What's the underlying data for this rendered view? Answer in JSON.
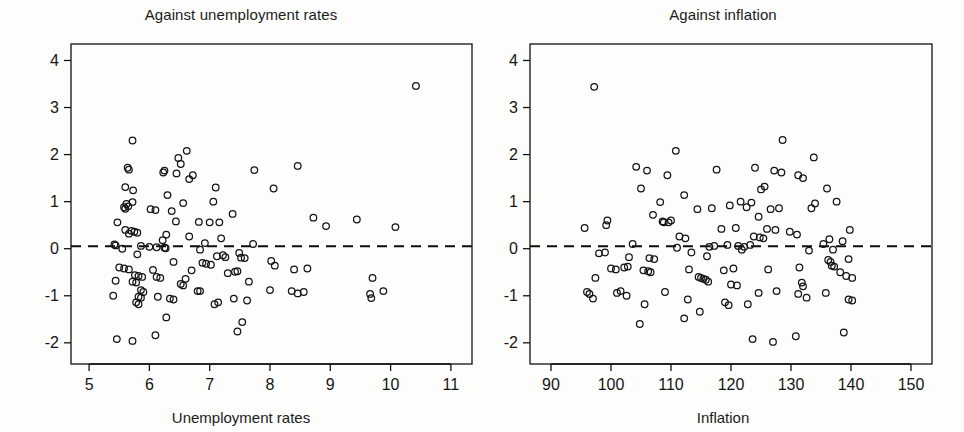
{
  "chart_data": [
    {
      "type": "scatter",
      "title": "Against unemployment rates",
      "xlabel": "Unemployment rates",
      "ylabel": "",
      "xlim": [
        4.7,
        11.35
      ],
      "ylim": [
        -2.45,
        4.35
      ],
      "xticks": [
        5,
        6,
        7,
        8,
        9,
        10,
        11
      ],
      "yticks": [
        -2,
        -1,
        0,
        1,
        2,
        3,
        4
      ],
      "xticklabels": [
        "5",
        "6",
        "7",
        "8",
        "9",
        "10",
        "11"
      ],
      "yticklabels": [
        "-2",
        "-1",
        "0",
        "1",
        "2",
        "3",
        "4"
      ],
      "grid": false,
      "legend": "none",
      "reference_line": {
        "orientation": "horizontal",
        "y": 0.05,
        "style": "dashed"
      },
      "marker": "open-circle",
      "points": [
        [
          10.42,
          3.46
        ],
        [
          5.72,
          2.3
        ],
        [
          6.62,
          2.08
        ],
        [
          6.48,
          1.93
        ],
        [
          6.52,
          1.8
        ],
        [
          8.46,
          1.76
        ],
        [
          5.64,
          1.72
        ],
        [
          5.66,
          1.68
        ],
        [
          7.74,
          1.67
        ],
        [
          6.25,
          1.66
        ],
        [
          6.23,
          1.62
        ],
        [
          6.45,
          1.6
        ],
        [
          6.72,
          1.56
        ],
        [
          6.66,
          1.48
        ],
        [
          5.6,
          1.31
        ],
        [
          7.1,
          1.3
        ],
        [
          8.06,
          1.28
        ],
        [
          5.73,
          1.24
        ],
        [
          6.3,
          1.14
        ],
        [
          7.06,
          1.0
        ],
        [
          5.72,
          0.99
        ],
        [
          6.56,
          0.97
        ],
        [
          5.62,
          0.95
        ],
        [
          5.65,
          0.9
        ],
        [
          5.58,
          0.88
        ],
        [
          5.6,
          0.85
        ],
        [
          6.02,
          0.84
        ],
        [
          6.1,
          0.82
        ],
        [
          6.37,
          0.8
        ],
        [
          7.38,
          0.74
        ],
        [
          8.72,
          0.66
        ],
        [
          9.44,
          0.62
        ],
        [
          6.44,
          0.58
        ],
        [
          6.82,
          0.57
        ],
        [
          7.0,
          0.56
        ],
        [
          7.16,
          0.56
        ],
        [
          5.47,
          0.56
        ],
        [
          8.93,
          0.48
        ],
        [
          10.08,
          0.46
        ],
        [
          5.6,
          0.4
        ],
        [
          5.7,
          0.38
        ],
        [
          5.75,
          0.36
        ],
        [
          5.8,
          0.34
        ],
        [
          5.66,
          0.32
        ],
        [
          6.28,
          0.3
        ],
        [
          6.66,
          0.26
        ],
        [
          7.19,
          0.22
        ],
        [
          6.22,
          0.18
        ],
        [
          6.92,
          0.12
        ],
        [
          7.72,
          0.1
        ],
        [
          5.42,
          0.09
        ],
        [
          5.44,
          0.07
        ],
        [
          5.86,
          0.06
        ],
        [
          6.0,
          0.04
        ],
        [
          6.12,
          0.03
        ],
        [
          6.25,
          0.02
        ],
        [
          6.27,
          0.01
        ],
        [
          5.55,
          0.0
        ],
        [
          6.84,
          -0.02
        ],
        [
          7.49,
          -0.09
        ],
        [
          5.8,
          -0.12
        ],
        [
          7.22,
          -0.14
        ],
        [
          7.12,
          -0.16
        ],
        [
          7.26,
          -0.18
        ],
        [
          7.52,
          -0.19
        ],
        [
          7.58,
          -0.2
        ],
        [
          8.02,
          -0.26
        ],
        [
          6.4,
          -0.28
        ],
        [
          6.88,
          -0.3
        ],
        [
          6.94,
          -0.32
        ],
        [
          7.02,
          -0.34
        ],
        [
          8.08,
          -0.36
        ],
        [
          5.5,
          -0.4
        ],
        [
          5.58,
          -0.42
        ],
        [
          5.66,
          -0.44
        ],
        [
          6.06,
          -0.45
        ],
        [
          8.4,
          -0.44
        ],
        [
          8.62,
          -0.42
        ],
        [
          6.7,
          -0.46
        ],
        [
          7.3,
          -0.52
        ],
        [
          7.42,
          -0.49
        ],
        [
          7.46,
          -0.48
        ],
        [
          5.76,
          -0.56
        ],
        [
          5.82,
          -0.58
        ],
        [
          5.88,
          -0.6
        ],
        [
          6.12,
          -0.6
        ],
        [
          6.18,
          -0.62
        ],
        [
          6.6,
          -0.64
        ],
        [
          9.7,
          -0.62
        ],
        [
          5.44,
          -0.68
        ],
        [
          5.72,
          -0.7
        ],
        [
          5.78,
          -0.72
        ],
        [
          7.65,
          -0.7
        ],
        [
          6.52,
          -0.75
        ],
        [
          6.56,
          -0.78
        ],
        [
          5.86,
          -0.88
        ],
        [
          5.9,
          -0.92
        ],
        [
          6.8,
          -0.9
        ],
        [
          6.84,
          -0.9
        ],
        [
          8.0,
          -0.88
        ],
        [
          8.36,
          -0.9
        ],
        [
          8.46,
          -0.95
        ],
        [
          8.56,
          -0.92
        ],
        [
          9.66,
          -0.96
        ],
        [
          9.68,
          -1.05
        ],
        [
          9.88,
          -0.9
        ],
        [
          5.4,
          -1.0
        ],
        [
          5.82,
          -1.02
        ],
        [
          5.86,
          -1.04
        ],
        [
          6.14,
          -1.02
        ],
        [
          6.34,
          -1.06
        ],
        [
          6.4,
          -1.08
        ],
        [
          7.4,
          -1.06
        ],
        [
          7.62,
          -1.1
        ],
        [
          5.78,
          -1.14
        ],
        [
          5.82,
          -1.18
        ],
        [
          7.08,
          -1.18
        ],
        [
          7.14,
          -1.14
        ],
        [
          6.28,
          -1.46
        ],
        [
          7.54,
          -1.56
        ],
        [
          6.1,
          -1.84
        ],
        [
          7.46,
          -1.76
        ],
        [
          5.46,
          -1.92
        ],
        [
          5.72,
          -1.96
        ]
      ]
    },
    {
      "type": "scatter",
      "title": "Against inflation",
      "xlabel": "Inflation",
      "ylabel": "",
      "xlim": [
        86.5,
        153.5
      ],
      "ylim": [
        -2.45,
        4.35
      ],
      "xticks": [
        90,
        100,
        110,
        120,
        130,
        140,
        150
      ],
      "yticks": [
        -2,
        -1,
        0,
        1,
        2,
        3,
        4
      ],
      "xticklabels": [
        "90",
        "100",
        "110",
        "120",
        "130",
        "140",
        "150"
      ],
      "yticklabels": [
        "-2",
        "-1",
        "0",
        "1",
        "2",
        "3",
        "4"
      ],
      "grid": false,
      "legend": "none",
      "reference_line": {
        "orientation": "horizontal",
        "y": 0.05,
        "style": "dashed"
      },
      "marker": "open-circle",
      "points": [
        [
          97.2,
          3.44
        ],
        [
          128.6,
          2.31
        ],
        [
          110.8,
          2.08
        ],
        [
          133.8,
          1.94
        ],
        [
          104.2,
          1.74
        ],
        [
          124.0,
          1.72
        ],
        [
          106.0,
          1.66
        ],
        [
          127.2,
          1.66
        ],
        [
          128.4,
          1.62
        ],
        [
          117.6,
          1.68
        ],
        [
          131.2,
          1.56
        ],
        [
          132.0,
          1.5
        ],
        [
          109.4,
          1.56
        ],
        [
          125.6,
          1.32
        ],
        [
          125.0,
          1.26
        ],
        [
          105.0,
          1.28
        ],
        [
          136.0,
          1.28
        ],
        [
          112.2,
          1.14
        ],
        [
          137.6,
          1.0
        ],
        [
          108.2,
          0.99
        ],
        [
          121.6,
          1.0
        ],
        [
          134.0,
          0.96
        ],
        [
          123.4,
          0.98
        ],
        [
          119.8,
          0.92
        ],
        [
          122.6,
          0.88
        ],
        [
          128.0,
          0.86
        ],
        [
          116.8,
          0.86
        ],
        [
          114.4,
          0.84
        ],
        [
          133.4,
          0.86
        ],
        [
          126.6,
          0.84
        ],
        [
          107.0,
          0.72
        ],
        [
          124.6,
          0.68
        ],
        [
          110.0,
          0.6
        ],
        [
          108.6,
          0.58
        ],
        [
          108.8,
          0.56
        ],
        [
          109.6,
          0.56
        ],
        [
          99.4,
          0.6
        ],
        [
          99.2,
          0.5
        ],
        [
          118.4,
          0.42
        ],
        [
          120.8,
          0.44
        ],
        [
          126.0,
          0.42
        ],
        [
          127.4,
          0.4
        ],
        [
          129.8,
          0.36
        ],
        [
          131.0,
          0.3
        ],
        [
          139.8,
          0.4
        ],
        [
          95.6,
          0.44
        ],
        [
          111.4,
          0.26
        ],
        [
          112.4,
          0.22
        ],
        [
          123.8,
          0.26
        ],
        [
          124.8,
          0.24
        ],
        [
          125.4,
          0.22
        ],
        [
          136.4,
          0.2
        ],
        [
          138.6,
          0.16
        ],
        [
          103.6,
          0.1
        ],
        [
          117.2,
          0.06
        ],
        [
          119.4,
          0.08
        ],
        [
          121.2,
          0.06
        ],
        [
          122.2,
          0.04
        ],
        [
          123.2,
          0.08
        ],
        [
          111.0,
          0.02
        ],
        [
          116.4,
          0.04
        ],
        [
          135.4,
          0.1
        ],
        [
          137.0,
          -0.02
        ],
        [
          98.0,
          -0.1
        ],
        [
          99.0,
          -0.08
        ],
        [
          113.4,
          -0.08
        ],
        [
          121.8,
          -0.02
        ],
        [
          133.0,
          -0.04
        ],
        [
          103.0,
          -0.18
        ],
        [
          106.4,
          -0.2
        ],
        [
          107.2,
          -0.22
        ],
        [
          116.0,
          -0.16
        ],
        [
          136.2,
          -0.24
        ],
        [
          136.6,
          -0.28
        ],
        [
          139.6,
          -0.22
        ],
        [
          100.0,
          -0.42
        ],
        [
          100.8,
          -0.44
        ],
        [
          102.2,
          -0.4
        ],
        [
          102.8,
          -0.38
        ],
        [
          105.4,
          -0.46
        ],
        [
          106.2,
          -0.48
        ],
        [
          106.6,
          -0.5
        ],
        [
          113.0,
          -0.44
        ],
        [
          118.8,
          -0.46
        ],
        [
          120.4,
          -0.42
        ],
        [
          126.2,
          -0.44
        ],
        [
          131.4,
          -0.4
        ],
        [
          136.8,
          -0.36
        ],
        [
          137.2,
          -0.38
        ],
        [
          97.4,
          -0.62
        ],
        [
          114.6,
          -0.6
        ],
        [
          115.0,
          -0.62
        ],
        [
          115.4,
          -0.64
        ],
        [
          115.8,
          -0.66
        ],
        [
          116.2,
          -0.7
        ],
        [
          138.2,
          -0.5
        ],
        [
          139.2,
          -0.58
        ],
        [
          140.2,
          -0.62
        ],
        [
          120.0,
          -0.76
        ],
        [
          121.0,
          -0.78
        ],
        [
          131.8,
          -0.72
        ],
        [
          132.0,
          -0.8
        ],
        [
          96.0,
          -0.92
        ],
        [
          96.4,
          -0.96
        ],
        [
          97.0,
          -1.06
        ],
        [
          101.0,
          -0.94
        ],
        [
          101.6,
          -0.9
        ],
        [
          102.6,
          -1.0
        ],
        [
          109.0,
          -0.92
        ],
        [
          124.6,
          -0.94
        ],
        [
          127.6,
          -0.9
        ],
        [
          131.2,
          -0.96
        ],
        [
          132.6,
          -1.04
        ],
        [
          135.8,
          -0.94
        ],
        [
          139.6,
          -1.08
        ],
        [
          140.2,
          -1.1
        ],
        [
          105.6,
          -1.18
        ],
        [
          112.8,
          -1.08
        ],
        [
          119.0,
          -1.14
        ],
        [
          119.6,
          -1.2
        ],
        [
          122.8,
          -1.18
        ],
        [
          112.2,
          -1.48
        ],
        [
          114.8,
          -1.34
        ],
        [
          104.8,
          -1.6
        ],
        [
          138.8,
          -1.78
        ],
        [
          130.8,
          -1.86
        ],
        [
          123.6,
          -1.92
        ],
        [
          127.0,
          -1.98
        ]
      ]
    }
  ],
  "panels": [
    {
      "name": "unemployment",
      "title": "Against unemployment rates",
      "xlabel": "Unemployment rates"
    },
    {
      "name": "inflation",
      "title": "Against inflation",
      "xlabel": "Inflation"
    }
  ],
  "style": {
    "background": "#fdfdfb",
    "ink": "#141414",
    "marker_radius_px": 3.3
  }
}
